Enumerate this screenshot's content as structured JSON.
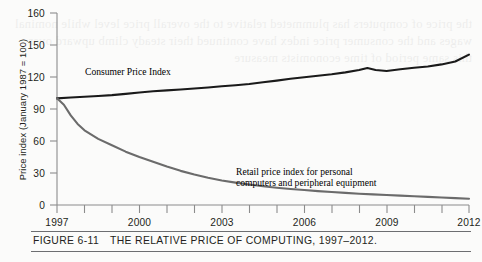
{
  "figure": {
    "number_label": "FIGURE 6-11",
    "title": "THE RELATIVE PRICE OF COMPUTING, 1997–2012."
  },
  "axes": {
    "y_title": "Price index (January 1987 = 100)",
    "y_ticks": [
      "160",
      "150",
      "120",
      "90",
      "60",
      "30",
      "0"
    ],
    "x_ticks": [
      "1997",
      "2000",
      "2003",
      "2006",
      "2009",
      "2012"
    ]
  },
  "annotations": {
    "cpi_label": "Consumer Price Index",
    "computer_label_line1": "Retail price index for personal",
    "computer_label_line2": "computers and peripheral equipment"
  },
  "colors": {
    "cpi_line": "#1a1a1a",
    "computer_line": "#6b6b6b",
    "axis": "#8c8c8c",
    "text": "#231f20",
    "page_background": "#fbfbfa"
  },
  "bleed_text": "the price of computers has plummeted relative to the overall price level while nominal wages and the consumer price index have continued their steady climb upward over this same period of time economists measure",
  "chart_data": {
    "type": "line",
    "title": "THE RELATIVE PRICE OF COMPUTING, 1997–2012.",
    "xlabel": "",
    "ylabel": "Price index (January 1987 = 100)",
    "xlim": [
      1997,
      2012
    ],
    "ylim": [
      0,
      160
    ],
    "yticks": [
      0,
      30,
      60,
      90,
      120,
      150,
      160
    ],
    "xticks": [
      1997,
      2000,
      2003,
      2006,
      2009,
      2012
    ],
    "grid": false,
    "legend": "inline-annotations",
    "series": [
      {
        "name": "Consumer Price Index",
        "color": "#1a1a1a",
        "x": [
          1997.0,
          1997.5,
          1998.0,
          1998.5,
          1999.0,
          1999.5,
          2000.0,
          2000.5,
          2001.0,
          2001.5,
          2002.0,
          2002.5,
          2003.0,
          2003.5,
          2004.0,
          2004.5,
          2005.0,
          2005.5,
          2006.0,
          2006.5,
          2007.0,
          2007.5,
          2008.0,
          2008.3,
          2008.6,
          2009.0,
          2009.5,
          2010.0,
          2010.5,
          2011.0,
          2011.5,
          2012.0
        ],
        "values": [
          100.0,
          100.8,
          101.5,
          102.2,
          103.0,
          104.2,
          105.5,
          106.6,
          107.5,
          108.3,
          109.2,
          110.2,
          111.3,
          112.3,
          113.5,
          115.0,
          116.6,
          118.3,
          119.8,
          121.2,
          122.6,
          124.3,
          126.5,
          128.4,
          126.6,
          125.6,
          127.2,
          128.6,
          129.8,
          131.8,
          134.5,
          141.0
        ]
      },
      {
        "name": "Retail price index for personal computers and peripheral equipment",
        "color": "#6b6b6b",
        "x": [
          1997.0,
          1997.25,
          1997.5,
          1997.75,
          1998.0,
          1998.5,
          1999.0,
          1999.5,
          2000.0,
          2000.5,
          2001.0,
          2001.5,
          2002.0,
          2002.5,
          2003.0,
          2003.5,
          2004.0,
          2004.5,
          2005.0,
          2005.5,
          2006.0,
          2006.5,
          2007.0,
          2007.5,
          2008.0,
          2008.5,
          2009.0,
          2009.5,
          2010.0,
          2010.5,
          2011.0,
          2011.5,
          2012.0
        ],
        "values": [
          100.0,
          94.0,
          84.0,
          76.0,
          70.0,
          62.0,
          56.0,
          50.0,
          45.0,
          40.5,
          36.0,
          32.0,
          28.5,
          25.5,
          23.0,
          21.0,
          19.2,
          17.6,
          16.2,
          15.0,
          14.0,
          13.0,
          12.2,
          11.4,
          10.6,
          10.0,
          9.4,
          8.8,
          8.2,
          7.6,
          7.0,
          6.4,
          5.8
        ]
      }
    ]
  }
}
